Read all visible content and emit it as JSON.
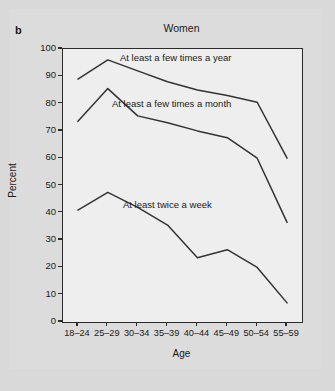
{
  "panel": {
    "label": "b"
  },
  "chart_data": {
    "type": "line",
    "title": "Women",
    "xlabel": "Age",
    "ylabel": "Percent",
    "ylim": [
      0,
      100
    ],
    "ytick_step": 10,
    "grid": false,
    "legend_position": "inline-annotations",
    "categories": [
      "18–24",
      "25–29",
      "30–34",
      "35–39",
      "40–44",
      "45–49",
      "50–54",
      "55–59"
    ],
    "yticks": [
      "0",
      "10",
      "20",
      "30",
      "40",
      "50",
      "60",
      "70",
      "80",
      "90",
      "100"
    ],
    "series": [
      {
        "name": "At least a few times a year",
        "values": [
          89,
          96,
          92,
          88,
          85,
          83,
          80.5,
          60
        ]
      },
      {
        "name": "At least a few times a month",
        "values": [
          73.5,
          85.5,
          75.5,
          73,
          70,
          67.5,
          60,
          36.5
        ]
      },
      {
        "name": "At least twice a week",
        "values": [
          41,
          47.5,
          42,
          35.5,
          23.5,
          26.5,
          20,
          7
        ]
      }
    ],
    "colors": {
      "line": "#333333",
      "plot_background": "#eeeeee",
      "figure_background": "#d9d9d9",
      "axis": "#2b2b2b",
      "text": "#1a1a1a"
    }
  }
}
